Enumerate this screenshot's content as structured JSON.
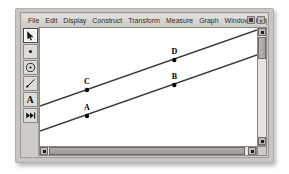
{
  "window": {
    "app_title": "Sketch",
    "controls": [
      {
        "name": "restore-button",
        "glyph": ""
      },
      {
        "name": "close-button",
        "glyph": "×"
      }
    ]
  },
  "menubar": {
    "items": [
      {
        "label": "File"
      },
      {
        "label": "Edit"
      },
      {
        "label": "Display"
      },
      {
        "label": "Construct"
      },
      {
        "label": "Transform"
      },
      {
        "label": "Measure"
      },
      {
        "label": "Graph"
      },
      {
        "label": "Window"
      },
      {
        "label": "Help"
      }
    ]
  },
  "toolbar": {
    "tools": [
      {
        "name": "selection-arrow-tool",
        "icon": "arrow-icon",
        "selected": true,
        "label": ""
      },
      {
        "name": "point-tool",
        "icon": "point-icon",
        "selected": false,
        "label": ""
      },
      {
        "name": "compass-circle-tool",
        "icon": "circle-icon",
        "selected": false,
        "label": ""
      },
      {
        "name": "straightedge-tool",
        "icon": "line-icon",
        "selected": false,
        "label": ""
      },
      {
        "name": "text-tool",
        "icon": "text-a-icon",
        "selected": false,
        "label": "A"
      },
      {
        "name": "custom-tool",
        "icon": "fast-forward-icon",
        "selected": false,
        "label": ""
      }
    ]
  },
  "canvas": {
    "background": "#ffffff",
    "line_color": "#3a3a3a",
    "point_color": "#000000",
    "label_color": "#000000",
    "lines": [
      {
        "name": "upper-line",
        "x1": 0,
        "y1": 78,
        "x2": 231,
        "y2": 2
      },
      {
        "name": "lower-line",
        "x1": 0,
        "y1": 103,
        "x2": 231,
        "y2": 27
      }
    ],
    "points": [
      {
        "label": "C",
        "x": 50,
        "y": 62,
        "on_line": "upper-line"
      },
      {
        "label": "D",
        "x": 143,
        "y": 32,
        "on_line": "upper-line"
      },
      {
        "label": "A",
        "x": 50,
        "y": 88,
        "on_line": "lower-line"
      },
      {
        "label": "B",
        "x": 143,
        "y": 57,
        "on_line": "lower-line"
      }
    ]
  },
  "scrollbars": {
    "vertical": {
      "name": "vertical-scrollbar",
      "thumb_top": 9,
      "thumb_size": 22
    },
    "horizontal": {
      "name": "horizontal-scrollbar",
      "thumb_left": 9,
      "thumb_size": 196
    }
  }
}
